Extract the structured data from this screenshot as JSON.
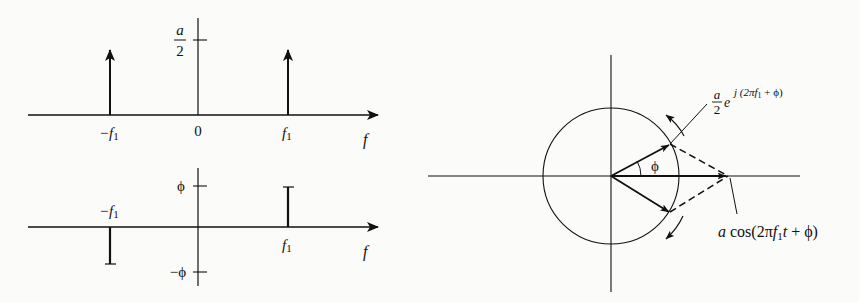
{
  "figure": {
    "type": "spectrum-and-phasor-diagram",
    "amplitude_spectrum": {
      "axis_label": "f",
      "origin_label": "0",
      "tick_label_numerator": "a",
      "tick_label_denominator": "2",
      "neg_freq_label": "−f",
      "pos_freq_label": "f",
      "subscript": "1",
      "impulses": [
        {
          "freq": "-f1",
          "height": "a/2"
        },
        {
          "freq": "f1",
          "height": "a/2"
        }
      ]
    },
    "phase_spectrum": {
      "axis_label": "f",
      "pos_tick_label": "ϕ",
      "neg_tick_label": "−ϕ",
      "neg_freq_label": "−f",
      "pos_freq_label": "f",
      "subscript": "1",
      "lines": [
        {
          "freq": "-f1",
          "value": "-ϕ"
        },
        {
          "freq": "f1",
          "value": "ϕ"
        }
      ]
    },
    "phasor": {
      "angle_label": "ϕ",
      "upper_label_numerator": "a",
      "upper_label_denominator": "2",
      "upper_label_base": "e",
      "upper_label_exponent_prefix": "j (2π",
      "upper_label_exponent_f": "f",
      "upper_label_exponent_sub": "1",
      "upper_label_exponent_suffix": " + ϕ)",
      "sum_label_a": "a",
      "sum_label_mid": " cos(2π",
      "sum_label_f": "f",
      "sum_label_sub": "1",
      "sum_label_t": "t",
      "sum_label_suffix": " + ϕ)"
    }
  }
}
